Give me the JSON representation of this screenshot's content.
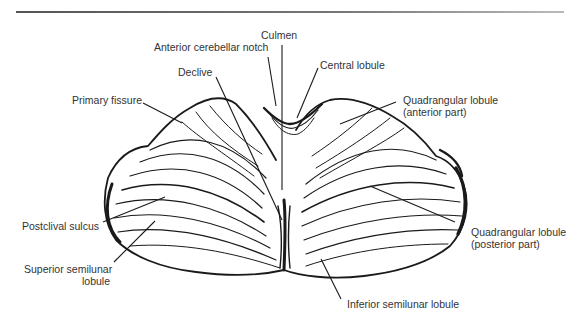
{
  "figure": {
    "labels": {
      "culmen": "Culmen",
      "anterior_cerebellar_notch": "Anterior cerebellar notch",
      "central_lobule": "Central lobule",
      "declive": "Declive",
      "primary_fissure": "Primary fissure",
      "quadrangular_anterior_line1": "Quadrangular lobule",
      "quadrangular_anterior_line2": "(anterior part)",
      "postclival_sulcus": "Postclival sulcus",
      "superior_semilunar_line1": "Superior semilunar",
      "superior_semilunar_line2": "lobule",
      "quadrangular_posterior_line1": "Quadrangular lobule",
      "quadrangular_posterior_line2": "(posterior part)",
      "inferior_semilunar": "Inferior semilunar lobule"
    },
    "colors": {
      "ink": "#1a1a1a",
      "label_text": "#333333",
      "background": "#ffffff"
    }
  }
}
